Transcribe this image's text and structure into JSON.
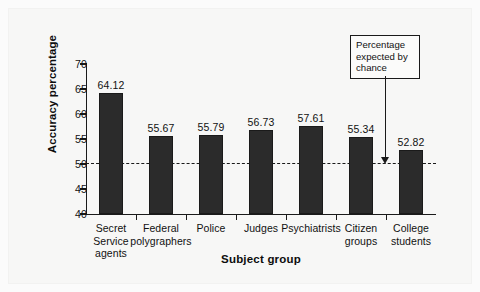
{
  "chart_data": {
    "type": "bar",
    "title": "",
    "xlabel": "Subject group",
    "ylabel": "Accuracy percentage",
    "categories": [
      "Secret Service\nagents",
      "Federal\npolygraphers",
      "Police",
      "Judges",
      "Psychiatrists",
      "Citizen\ngroups",
      "College\nstudents"
    ],
    "values": [
      64.12,
      55.67,
      55.79,
      56.73,
      57.61,
      55.34,
      52.82
    ],
    "value_labels": [
      "64.12",
      "55.67",
      "55.79",
      "56.73",
      "57.61",
      "55.34",
      "52.82"
    ],
    "ylim": [
      40,
      70
    ],
    "yticks": [
      40,
      45,
      50,
      55,
      60,
      65,
      70
    ],
    "ytick_labels": [
      "40",
      "45",
      "50",
      "55",
      "60",
      "65",
      "70"
    ],
    "grid": false,
    "legend": "none",
    "bar_color": "#2b2b2b",
    "reference_line": {
      "value": 50,
      "style": "dashed",
      "color": "#1a1a1a",
      "annotation": "Percentage expected by chance",
      "annotation_lines": [
        "Percentage",
        "expected by",
        "chance"
      ]
    }
  },
  "figure": {
    "background": "#f7f7f6",
    "axis_color": "#1a1a1a",
    "text_color": "#111111"
  }
}
